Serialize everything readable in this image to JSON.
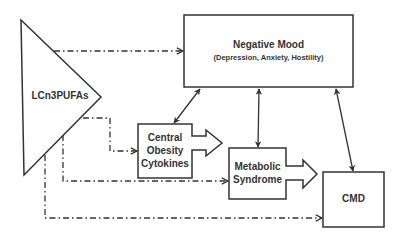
{
  "nodes": {
    "lcn3pufas": {
      "label": "LCn3PUFAs"
    },
    "negative_mood": {
      "label": "Negative Mood",
      "sublabel": "(Depression, Anxiety, Hostility)"
    },
    "central_obesity": {
      "line1": "Central",
      "line2": "Obesity",
      "line3": "Cytokines"
    },
    "metabolic_syndrome": {
      "line1": "Metabolic",
      "line2": "Syndrome"
    },
    "cmd": {
      "label": "CMD"
    }
  },
  "edges": [
    {
      "from": "LCn3PUFAs",
      "to": "Negative Mood",
      "style": "dash-dot",
      "direction": "one-way"
    },
    {
      "from": "LCn3PUFAs",
      "to": "Central Obesity Cytokines",
      "style": "dash-dot",
      "direction": "one-way"
    },
    {
      "from": "LCn3PUFAs",
      "to": "Metabolic Syndrome",
      "style": "dash-dot",
      "direction": "one-way"
    },
    {
      "from": "LCn3PUFAs",
      "to": "CMD",
      "style": "dash-dot",
      "direction": "one-way"
    },
    {
      "from": "Negative Mood",
      "to": "Central Obesity Cytokines",
      "style": "solid",
      "direction": "bidirectional"
    },
    {
      "from": "Negative Mood",
      "to": "Metabolic Syndrome",
      "style": "solid",
      "direction": "bidirectional"
    },
    {
      "from": "Negative Mood",
      "to": "CMD",
      "style": "solid",
      "direction": "bidirectional"
    },
    {
      "from": "Central Obesity Cytokines",
      "to": "Metabolic Syndrome",
      "style": "block-arrow",
      "direction": "one-way"
    },
    {
      "from": "Metabolic Syndrome",
      "to": "CMD",
      "style": "block-arrow",
      "direction": "one-way"
    }
  ],
  "colors": {
    "stroke": "#333333",
    "text": "#333333",
    "background": "#ffffff"
  }
}
